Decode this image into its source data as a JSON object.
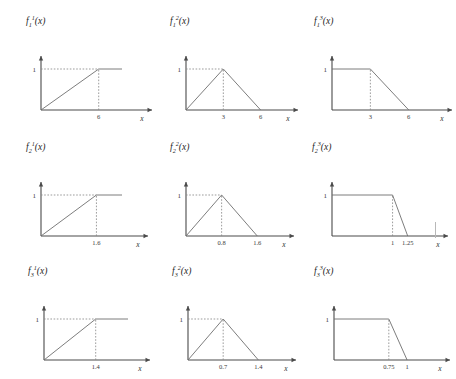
{
  "figure": {
    "rows": 3,
    "columns": 3,
    "axis_x_label": "x",
    "level_label": "1"
  },
  "chart_data": [
    {
      "type": "line",
      "title": "f_1^1(x)",
      "title_base": "f",
      "title_sub": "1",
      "title_sup": "1",
      "xlabel": "x",
      "ylabel": "",
      "shape": "saturating-ramp",
      "x": [
        0,
        6,
        9
      ],
      "values": [
        0,
        1,
        1
      ],
      "xticks": [
        6
      ],
      "xtick_labels": [
        "6"
      ],
      "yticks": [
        1
      ],
      "ytick_labels": [
        "1"
      ],
      "xlim": [
        0,
        10.5
      ],
      "ylim": [
        0,
        1.35
      ],
      "grid": false,
      "guides": [
        "horizontal dashed at y=1 to x=6",
        "vertical dashed at x=6 up to y=1"
      ]
    },
    {
      "type": "line",
      "title": "f_1^2(x)",
      "title_base": "f",
      "title_sub": "1",
      "title_sup": "2",
      "xlabel": "x",
      "ylabel": "",
      "shape": "triangle",
      "x": [
        0,
        3,
        6
      ],
      "values": [
        0,
        1,
        0
      ],
      "xticks": [
        3,
        6
      ],
      "xtick_labels": [
        "3",
        "6"
      ],
      "yticks": [
        1
      ],
      "ytick_labels": [
        "1"
      ],
      "xlim": [
        0,
        8.2
      ],
      "ylim": [
        0,
        1.35
      ],
      "grid": false,
      "guides": [
        "horizontal dashed at y=1 to x=3",
        "vertical dashed at x=3 up to y=1"
      ]
    },
    {
      "type": "line",
      "title": "f_1^3(x)",
      "title_base": "f",
      "title_sub": "1",
      "title_sup": "3",
      "xlabel": "x",
      "ylabel": "",
      "shape": "falling-shoulder",
      "x": [
        0,
        3,
        6
      ],
      "values": [
        1,
        1,
        0
      ],
      "xticks": [
        3,
        6
      ],
      "xtick_labels": [
        "3",
        "6"
      ],
      "yticks": [
        1
      ],
      "ytick_labels": [
        "1"
      ],
      "xlim": [
        0,
        8.6
      ],
      "ylim": [
        0,
        1.35
      ],
      "grid": false,
      "guides": [
        "vertical dashed at x=3 up to y=1"
      ]
    },
    {
      "type": "line",
      "title": "f_2^1(x)",
      "title_base": "f",
      "title_sub": "2",
      "title_sup": "1",
      "xlabel": "x",
      "ylabel": "",
      "shape": "saturating-ramp",
      "x": [
        0,
        1.6,
        2.4
      ],
      "values": [
        0,
        1,
        1
      ],
      "xticks": [
        1.6
      ],
      "xtick_labels": [
        "1.6"
      ],
      "yticks": [
        1
      ],
      "ytick_labels": [
        "1"
      ],
      "xlim": [
        0,
        2.8
      ],
      "ylim": [
        0,
        1.35
      ],
      "grid": false,
      "guides": [
        "horizontal dashed at y=1 to x=1.6",
        "vertical dashed at x=1.6 up to y=1"
      ]
    },
    {
      "type": "line",
      "title": "f_2^2(x)",
      "title_base": "f",
      "title_sub": "2",
      "title_sup": "2",
      "xlabel": "x",
      "ylabel": "",
      "shape": "triangle",
      "x": [
        0,
        0.8,
        1.6
      ],
      "values": [
        0,
        1,
        0
      ],
      "xticks": [
        0.8,
        1.6
      ],
      "xtick_labels": [
        "0.8",
        "1.6"
      ],
      "yticks": [
        1
      ],
      "ytick_labels": [
        "1"
      ],
      "xlim": [
        0,
        2.2
      ],
      "ylim": [
        0,
        1.35
      ],
      "grid": false,
      "guides": [
        "horizontal dashed at y=1 to x=0.8",
        "vertical dashed at x=0.8 up to y=1"
      ]
    },
    {
      "type": "line",
      "title": "f_2^3(x)",
      "title_base": "f",
      "title_sub": "2",
      "title_sup": "3",
      "xlabel": "x",
      "ylabel": "",
      "shape": "falling-shoulder",
      "x": [
        0,
        1,
        1.25
      ],
      "values": [
        1,
        1,
        0
      ],
      "xticks": [
        1,
        1.25
      ],
      "xtick_labels": [
        "1",
        "1.25"
      ],
      "yticks": [
        1
      ],
      "ytick_labels": [
        "1"
      ],
      "xlim": [
        0,
        1.75
      ],
      "ylim": [
        0,
        1.35
      ],
      "grid": false,
      "guides": [
        "vertical dashed at x=1 up to y=1"
      ]
    },
    {
      "type": "line",
      "title": "f_3^1(x)",
      "title_base": "f",
      "title_sub": "3",
      "title_sup": "1",
      "xlabel": "x",
      "ylabel": "",
      "shape": "saturating-ramp",
      "x": [
        0,
        1.4,
        2.1
      ],
      "values": [
        0,
        1,
        1
      ],
      "xticks": [
        1.4
      ],
      "xtick_labels": [
        "1.4"
      ],
      "yticks": [
        1
      ],
      "ytick_labels": [
        "1"
      ],
      "xlim": [
        0,
        2.6
      ],
      "ylim": [
        0,
        1.35
      ],
      "grid": false,
      "guides": [
        "horizontal dashed at y=1 to x=1.4",
        "vertical dashed at x=1.4 up to y=1"
      ]
    },
    {
      "type": "line",
      "title": "f_3^2(x)",
      "title_base": "f",
      "title_sub": "3",
      "title_sup": "2",
      "xlabel": "x",
      "ylabel": "",
      "shape": "triangle",
      "x": [
        0,
        0.7,
        1.4
      ],
      "values": [
        0,
        1,
        0
      ],
      "xticks": [
        0.7,
        1.4
      ],
      "xtick_labels": [
        "0.7",
        "1.4"
      ],
      "yticks": [
        1
      ],
      "ytick_labels": [
        "1"
      ],
      "xlim": [
        0,
        1.95
      ],
      "ylim": [
        0,
        1.35
      ],
      "grid": false,
      "guides": [
        "horizontal dashed at y=1 to x=0.7",
        "vertical dashed at x=0.7 up to y=1"
      ]
    },
    {
      "type": "line",
      "title": "f_3^3(x)",
      "title_base": "f",
      "title_sub": "3",
      "title_sup": "3",
      "xlabel": "x",
      "ylabel": "",
      "shape": "falling-shoulder",
      "x": [
        0,
        0.75,
        1
      ],
      "values": [
        1,
        1,
        0
      ],
      "xticks": [
        0.75,
        1
      ],
      "xtick_labels": [
        "0.75",
        "1"
      ],
      "yticks": [
        1
      ],
      "ytick_labels": [
        "1"
      ],
      "xlim": [
        0,
        1.45
      ],
      "ylim": [
        0,
        1.35
      ],
      "grid": false,
      "guides": [
        "vertical dashed at x=0.75 up to y=1"
      ]
    }
  ],
  "style": {
    "axis_color": "#4a4a4a",
    "curve_color": "#6e6e6e",
    "guide_color": "#8a8a8a",
    "background": "#ffffff"
  }
}
